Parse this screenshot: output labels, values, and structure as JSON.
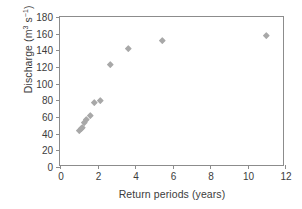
{
  "chart_data": {
    "type": "scatter",
    "title": "",
    "xlabel": "Return periods (years)",
    "ylabel": "Discharge (m3 s-1)",
    "ylabel_parts": {
      "text": "Discharge (m",
      "sup1": "3",
      "mid": " s",
      "sup2": "−1",
      "close": ")"
    },
    "xlim": [
      0,
      12
    ],
    "ylim": [
      0,
      180
    ],
    "xticks": [
      0,
      2,
      4,
      6,
      8,
      10,
      12
    ],
    "yticks": [
      0,
      20,
      40,
      60,
      80,
      100,
      120,
      140,
      160,
      180
    ],
    "grid": false,
    "legend": null,
    "marker": "diamond",
    "marker_color": "#a8a8a8",
    "axis_color": "#8c8c8c",
    "points": [
      {
        "x": 1.05,
        "y": 44
      },
      {
        "x": 1.12,
        "y": 46
      },
      {
        "x": 1.2,
        "y": 48
      },
      {
        "x": 1.32,
        "y": 54
      },
      {
        "x": 1.42,
        "y": 57
      },
      {
        "x": 1.6,
        "y": 62
      },
      {
        "x": 1.85,
        "y": 78
      },
      {
        "x": 2.15,
        "y": 80
      },
      {
        "x": 2.7,
        "y": 123
      },
      {
        "x": 3.65,
        "y": 142
      },
      {
        "x": 5.45,
        "y": 152
      },
      {
        "x": 11.0,
        "y": 158
      }
    ]
  }
}
